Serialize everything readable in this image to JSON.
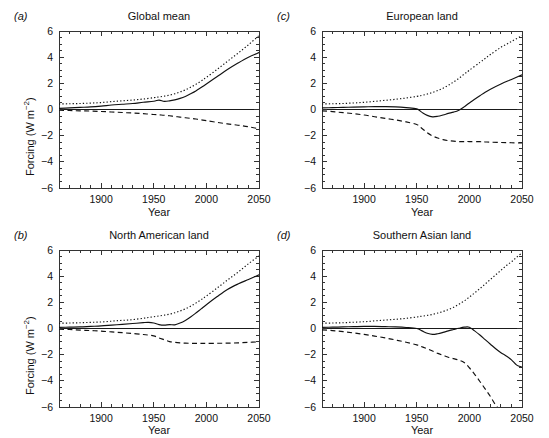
{
  "figure": {
    "axis_ylabel_prefix": "Forcing (W m",
    "axis_ylabel_exponent": "−2",
    "axis_ylabel_suffix": ")",
    "axis_xlabel": "Year",
    "line_color": "#111111"
  },
  "chart_data": [
    {
      "type": "line",
      "panel_label": "(a)",
      "title": "Global mean",
      "xlabel": "Year",
      "ylabel": "Forcing (W m−2)",
      "xlim": [
        1860,
        2050
      ],
      "ylim": [
        -6,
        6
      ],
      "xticks": [
        1900,
        1950,
        2000,
        2050
      ],
      "xticklabels": [
        "1900",
        "1950",
        "2000",
        "2050"
      ],
      "yticks": [
        -6,
        -4,
        -2,
        0,
        2,
        4,
        6
      ],
      "yticklabels": [
        "−6",
        "−4",
        "−2",
        "0",
        "2",
        "4",
        "6"
      ],
      "grid": false,
      "legend": "none",
      "zero_line": 0,
      "x": [
        1860,
        1870,
        1880,
        1890,
        1900,
        1910,
        1920,
        1930,
        1940,
        1950,
        1955,
        1960,
        1965,
        1970,
        1975,
        1980,
        1985,
        1990,
        1995,
        2000,
        2010,
        2020,
        2030,
        2040,
        2050
      ],
      "series": [
        {
          "name": "total",
          "style": "solid",
          "values": [
            0.08,
            0.12,
            0.16,
            0.2,
            0.26,
            0.34,
            0.4,
            0.46,
            0.55,
            0.63,
            0.72,
            0.62,
            0.66,
            0.74,
            0.85,
            1.0,
            1.2,
            1.42,
            1.68,
            1.95,
            2.5,
            3.05,
            3.55,
            4.0,
            4.35
          ]
        },
        {
          "name": "greenhouse-gases",
          "style": "dotted",
          "values": [
            0.42,
            0.44,
            0.46,
            0.49,
            0.53,
            0.6,
            0.66,
            0.72,
            0.8,
            0.9,
            0.96,
            1.02,
            1.1,
            1.2,
            1.34,
            1.5,
            1.7,
            1.92,
            2.18,
            2.45,
            3.05,
            3.68,
            4.3,
            4.95,
            5.65
          ]
        },
        {
          "name": "aerosols",
          "style": "dashed",
          "values": [
            -0.06,
            -0.08,
            -0.1,
            -0.12,
            -0.15,
            -0.19,
            -0.23,
            -0.27,
            -0.32,
            -0.38,
            -0.41,
            -0.44,
            -0.48,
            -0.53,
            -0.58,
            -0.63,
            -0.68,
            -0.73,
            -0.79,
            -0.85,
            -0.98,
            -1.1,
            -1.2,
            -1.32,
            -1.48
          ]
        }
      ]
    },
    {
      "type": "line",
      "panel_label": "(b)",
      "title": "North American land",
      "xlabel": "Year",
      "ylabel": "Forcing (W m−2)",
      "xlim": [
        1860,
        2050
      ],
      "ylim": [
        -6,
        6
      ],
      "xticks": [
        1900,
        1950,
        2000,
        2050
      ],
      "xticklabels": [
        "1900",
        "1950",
        "2000",
        "2050"
      ],
      "yticks": [
        -6,
        -4,
        -2,
        0,
        2,
        4,
        6
      ],
      "yticklabels": [
        "−6",
        "−4",
        "−2",
        "0",
        "2",
        "4",
        "6"
      ],
      "grid": false,
      "legend": "none",
      "zero_line": 0,
      "x": [
        1860,
        1870,
        1880,
        1890,
        1900,
        1910,
        1920,
        1930,
        1940,
        1945,
        1950,
        1955,
        1960,
        1965,
        1970,
        1975,
        1980,
        1985,
        1990,
        1995,
        2000,
        2010,
        2020,
        2030,
        2040,
        2050
      ],
      "series": [
        {
          "name": "total",
          "style": "solid",
          "values": [
            0.08,
            0.1,
            0.12,
            0.16,
            0.2,
            0.26,
            0.32,
            0.38,
            0.45,
            0.47,
            0.42,
            0.3,
            0.26,
            0.3,
            0.28,
            0.42,
            0.62,
            0.88,
            1.18,
            1.5,
            1.82,
            2.42,
            2.98,
            3.4,
            3.75,
            4.1
          ]
        },
        {
          "name": "greenhouse-gases",
          "style": "dotted",
          "values": [
            0.4,
            0.42,
            0.44,
            0.47,
            0.5,
            0.56,
            0.62,
            0.68,
            0.78,
            0.84,
            0.9,
            0.96,
            1.02,
            1.1,
            1.2,
            1.34,
            1.5,
            1.7,
            1.94,
            2.2,
            2.48,
            3.08,
            3.7,
            4.3,
            4.95,
            5.55
          ]
        },
        {
          "name": "aerosols",
          "style": "dashed",
          "values": [
            -0.06,
            -0.08,
            -0.12,
            -0.16,
            -0.2,
            -0.26,
            -0.32,
            -0.38,
            -0.46,
            -0.5,
            -0.56,
            -0.72,
            -0.86,
            -1.0,
            -1.06,
            -1.1,
            -1.12,
            -1.13,
            -1.14,
            -1.14,
            -1.14,
            -1.13,
            -1.12,
            -1.1,
            -1.06,
            -1.02
          ]
        }
      ]
    },
    {
      "type": "line",
      "panel_label": "(c)",
      "title": "European land",
      "xlabel": "Year",
      "ylabel": "Forcing (W m−2)",
      "xlim": [
        1860,
        2050
      ],
      "ylim": [
        -6,
        6
      ],
      "xticks": [
        1900,
        1950,
        2000,
        2050
      ],
      "xticklabels": [
        "1900",
        "1950",
        "2000",
        "2050"
      ],
      "yticks": [
        -6,
        -4,
        -2,
        0,
        2,
        4,
        6
      ],
      "yticklabels": [
        "−6",
        "−4",
        "−2",
        "0",
        "2",
        "4",
        "6"
      ],
      "grid": false,
      "legend": "none",
      "zero_line": 0,
      "x": [
        1860,
        1870,
        1880,
        1890,
        1900,
        1910,
        1920,
        1930,
        1940,
        1950,
        1955,
        1960,
        1965,
        1970,
        1975,
        1980,
        1985,
        1990,
        1995,
        2000,
        2010,
        2015,
        2020,
        2030,
        2040,
        2050
      ],
      "series": [
        {
          "name": "total",
          "style": "solid",
          "values": [
            0.12,
            0.14,
            0.16,
            0.18,
            0.2,
            0.22,
            0.22,
            0.2,
            0.14,
            0.05,
            -0.22,
            -0.45,
            -0.56,
            -0.52,
            -0.42,
            -0.3,
            -0.2,
            -0.05,
            0.2,
            0.5,
            1.05,
            1.32,
            1.55,
            1.95,
            2.3,
            2.65
          ]
        },
        {
          "name": "greenhouse-gases",
          "style": "dotted",
          "values": [
            0.42,
            0.44,
            0.46,
            0.5,
            0.55,
            0.62,
            0.7,
            0.78,
            0.88,
            1.0,
            1.08,
            1.18,
            1.3,
            1.45,
            1.62,
            1.85,
            2.1,
            2.38,
            2.7,
            3.0,
            3.6,
            3.9,
            4.2,
            4.75,
            5.2,
            5.65
          ]
        },
        {
          "name": "aerosols",
          "style": "dashed",
          "values": [
            -0.1,
            -0.16,
            -0.24,
            -0.32,
            -0.42,
            -0.55,
            -0.68,
            -0.8,
            -0.95,
            -1.15,
            -1.45,
            -1.78,
            -2.02,
            -2.18,
            -2.3,
            -2.38,
            -2.42,
            -2.45,
            -2.45,
            -2.45,
            -2.46,
            -2.48,
            -2.5,
            -2.52,
            -2.54,
            -2.56
          ]
        }
      ]
    },
    {
      "type": "line",
      "panel_label": "(d)",
      "title": "Southern Asian land",
      "xlabel": "Year",
      "ylabel": "Forcing (W m−2)",
      "xlim": [
        1860,
        2050
      ],
      "ylim": [
        -6,
        6
      ],
      "xticks": [
        1900,
        1950,
        2000,
        2050
      ],
      "xticklabels": [
        "1900",
        "1950",
        "2000",
        "2050"
      ],
      "yticks": [
        -6,
        -4,
        -2,
        0,
        2,
        4,
        6
      ],
      "yticklabels": [
        "−6",
        "−4",
        "−2",
        "0",
        "2",
        "4",
        "6"
      ],
      "grid": false,
      "legend": "none",
      "zero_line": 0,
      "x": [
        1860,
        1870,
        1880,
        1890,
        1900,
        1910,
        1920,
        1930,
        1940,
        1950,
        1955,
        1960,
        1965,
        1970,
        1975,
        1980,
        1985,
        1990,
        1995,
        2000,
        2005,
        2010,
        2015,
        2020,
        2025,
        2030,
        2035,
        2040,
        2045,
        2050
      ],
      "series": [
        {
          "name": "total",
          "style": "solid",
          "values": [
            0.08,
            0.1,
            0.12,
            0.14,
            0.16,
            0.16,
            0.14,
            0.12,
            0.08,
            0.0,
            -0.18,
            -0.36,
            -0.45,
            -0.4,
            -0.3,
            -0.18,
            -0.08,
            0.02,
            0.1,
            0.1,
            -0.18,
            -0.5,
            -0.85,
            -1.2,
            -1.55,
            -1.85,
            -2.1,
            -2.4,
            -2.8,
            -2.95
          ]
        },
        {
          "name": "greenhouse-gases",
          "style": "dotted",
          "values": [
            0.4,
            0.42,
            0.44,
            0.48,
            0.52,
            0.58,
            0.64,
            0.7,
            0.78,
            0.88,
            0.94,
            1.0,
            1.08,
            1.18,
            1.3,
            1.45,
            1.62,
            1.85,
            2.1,
            2.4,
            2.72,
            3.05,
            3.4,
            3.75,
            4.1,
            4.45,
            4.8,
            5.1,
            5.45,
            5.78
          ]
        },
        {
          "name": "aerosols",
          "style": "dashed",
          "values": [
            -0.1,
            -0.16,
            -0.24,
            -0.34,
            -0.45,
            -0.58,
            -0.72,
            -0.88,
            -1.05,
            -1.25,
            -1.4,
            -1.55,
            -1.72,
            -1.9,
            -2.05,
            -2.2,
            -2.3,
            -2.42,
            -2.6,
            -3.0,
            -3.5,
            -4.05,
            -4.62,
            -5.2,
            -5.85,
            -6.3,
            -6.8,
            -7.2,
            -7.6,
            -8.0
          ]
        }
      ]
    }
  ]
}
